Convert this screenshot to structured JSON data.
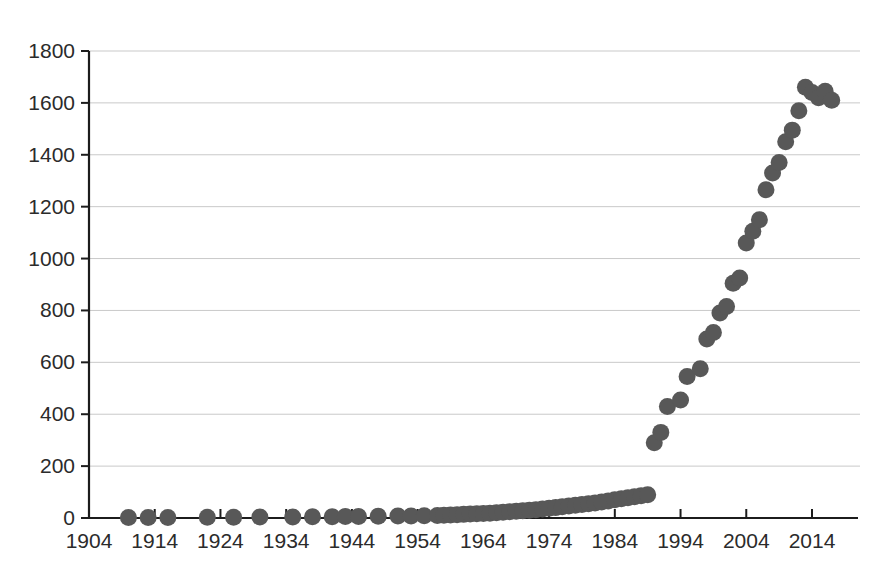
{
  "chart_data": {
    "type": "scatter",
    "title": "",
    "subtitle": "",
    "xlabel": "",
    "ylabel": "",
    "xlim": [
      1904,
      2021
    ],
    "ylim": [
      0,
      1800
    ],
    "grid": true,
    "legend": null,
    "legend_position": "none",
    "marker_color": "#585858",
    "marker_shape": "circle",
    "marker_size": 17,
    "xticks": [
      1904,
      1914,
      1924,
      1934,
      1944,
      1954,
      1964,
      1974,
      1984,
      1994,
      2004,
      2014
    ],
    "xtick_labels": [
      "1904",
      "1914",
      "1924",
      "1934",
      "1944",
      "1954",
      "1964",
      "1974",
      "1984",
      "1994",
      "2004",
      "2014"
    ],
    "yticks": [
      0,
      200,
      400,
      600,
      800,
      1000,
      1200,
      1400,
      1600,
      1800
    ],
    "ytick_labels": [
      "0",
      "200",
      "400",
      "600",
      "800",
      "1000",
      "1200",
      "1400",
      "1600",
      "1800"
    ],
    "annotations": [],
    "series": [
      {
        "name": "count",
        "x": [
          1910,
          1913,
          1916,
          1922,
          1926,
          1930,
          1935,
          1938,
          1941,
          1943,
          1945,
          1948,
          1951,
          1953,
          1955,
          1957,
          1958,
          1959,
          1960,
          1961,
          1962,
          1963,
          1964,
          1965,
          1966,
          1967,
          1968,
          1969,
          1970,
          1971,
          1972,
          1973,
          1974,
          1975,
          1976,
          1977,
          1978,
          1979,
          1980,
          1981,
          1982,
          1983,
          1984,
          1985,
          1986,
          1987,
          1988,
          1989,
          1990,
          1991,
          1992,
          1994,
          1995,
          1997,
          1998,
          1999,
          2000,
          2001,
          2002,
          2003,
          2004,
          2005,
          2006,
          2007,
          2008,
          2009,
          2010,
          2011,
          2012,
          2013,
          2014,
          2015,
          2016,
          2017
        ],
        "y": [
          2,
          2,
          2,
          3,
          3,
          4,
          4,
          5,
          5,
          6,
          6,
          7,
          8,
          8,
          9,
          10,
          11,
          12,
          13,
          14,
          15,
          16,
          17,
          18,
          20,
          22,
          24,
          26,
          28,
          30,
          32,
          35,
          38,
          40,
          43,
          46,
          49,
          52,
          55,
          58,
          62,
          66,
          70,
          74,
          78,
          82,
          86,
          90,
          290,
          330,
          430,
          455,
          545,
          575,
          690,
          715,
          790,
          815,
          905,
          925,
          1060,
          1105,
          1150,
          1265,
          1330,
          1370,
          1450,
          1495,
          1570,
          1660,
          1640,
          1620,
          1645,
          1610
        ]
      }
    ]
  }
}
